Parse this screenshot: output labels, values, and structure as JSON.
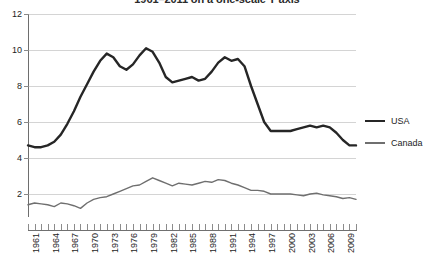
{
  "chart_data": {
    "type": "line",
    "title": "1961–2011 on a one-scale Y axis",
    "xlabel": "",
    "ylabel": "",
    "ylim": [
      0,
      12
    ],
    "yticks": [
      0,
      2,
      4,
      6,
      8,
      10,
      12
    ],
    "ytick_labels": [
      "0",
      "2",
      "4",
      "6",
      "8",
      "10",
      "12"
    ],
    "grid": true,
    "legend_position": "right",
    "x_start": 1961,
    "x_end": 2011,
    "xticks_labeled": [
      "1961",
      "1964",
      "1967",
      "1970",
      "1973",
      "1976",
      "1979",
      "1982",
      "1985",
      "1988",
      "1991",
      "1994",
      "1997",
      "2000",
      "2003",
      "2006",
      "2009"
    ],
    "x": [
      1961,
      1962,
      1963,
      1964,
      1965,
      1966,
      1967,
      1968,
      1969,
      1970,
      1971,
      1972,
      1973,
      1974,
      1975,
      1976,
      1977,
      1978,
      1979,
      1980,
      1981,
      1982,
      1983,
      1984,
      1985,
      1986,
      1987,
      1988,
      1989,
      1990,
      1991,
      1992,
      1993,
      1994,
      1995,
      1996,
      1997,
      1998,
      1999,
      2000,
      2001,
      2002,
      2003,
      2004,
      2005,
      2006,
      2007,
      2008,
      2009,
      2010,
      2011
    ],
    "series": [
      {
        "name": "USA",
        "color": "#262626",
        "width": 2.4,
        "values": [
          4.7,
          4.6,
          4.6,
          4.7,
          4.9,
          5.3,
          5.9,
          6.6,
          7.4,
          8.1,
          8.8,
          9.4,
          9.8,
          9.6,
          9.1,
          8.9,
          9.2,
          9.7,
          10.1,
          9.9,
          9.3,
          8.5,
          8.2,
          8.3,
          8.4,
          8.5,
          8.3,
          8.4,
          8.8,
          9.3,
          9.6,
          9.4,
          9.5,
          9.1,
          8.0,
          7.0,
          6.0,
          5.5,
          5.5,
          5.5,
          5.5,
          5.6,
          5.7,
          5.8,
          5.7,
          5.8,
          5.7,
          5.4,
          5.0,
          4.7,
          4.7
        ]
      },
      {
        "name": "Canada",
        "color": "#6f6f6f",
        "width": 1.4,
        "values": [
          1.4,
          1.5,
          1.45,
          1.4,
          1.3,
          1.5,
          1.45,
          1.35,
          1.2,
          1.5,
          1.7,
          1.8,
          1.85,
          2.0,
          2.15,
          2.3,
          2.45,
          2.5,
          2.7,
          2.9,
          2.75,
          2.6,
          2.45,
          2.6,
          2.55,
          2.5,
          2.6,
          2.7,
          2.65,
          2.8,
          2.75,
          2.6,
          2.5,
          2.35,
          2.2,
          2.2,
          2.15,
          2.0,
          2.0,
          2.0,
          2.0,
          1.95,
          1.9,
          2.0,
          2.05,
          1.95,
          1.9,
          1.85,
          1.75,
          1.8,
          1.7
        ]
      }
    ]
  },
  "legend": {
    "items": [
      {
        "label": "USA"
      },
      {
        "label": "Canada"
      }
    ]
  }
}
